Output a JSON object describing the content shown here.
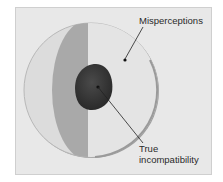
{
  "figure": {
    "labels": {
      "misperceptions": "Misperceptions",
      "true_incompat_line1": "True",
      "true_incompat_line2": "incompatibility"
    },
    "colors": {
      "background": "#e8e8e8",
      "outer_light": "#dedede",
      "band": "#a8a8a8",
      "right_half": "#e3e3e3",
      "rim": "#9a9a9a",
      "core": "#3a3a3a"
    }
  }
}
